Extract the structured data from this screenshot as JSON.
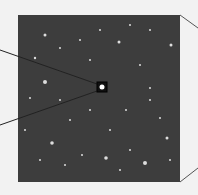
{
  "figure": {
    "colors": {
      "background": "#f2f2f2",
      "panel": "#3d3d3d",
      "lines": "#222222",
      "star": "#ffffff"
    },
    "highlight_box": {
      "x": 97,
      "y": 82,
      "w": 10,
      "h": 10
    },
    "stars": [
      [
        45,
        35,
        1.5
      ],
      [
        60,
        48,
        1
      ],
      [
        35,
        58,
        1.2
      ],
      [
        119,
        42,
        1.5
      ],
      [
        150,
        30,
        1
      ],
      [
        171,
        45,
        1.5
      ],
      [
        90,
        60,
        1
      ],
      [
        140,
        65,
        1
      ],
      [
        45,
        82,
        2
      ],
      [
        30,
        98,
        1
      ],
      [
        60,
        100,
        1
      ],
      [
        150,
        88,
        1
      ],
      [
        126,
        110,
        1
      ],
      [
        52,
        143,
        1.8
      ],
      [
        82,
        155,
        1
      ],
      [
        106,
        158,
        1.8
      ],
      [
        145,
        163,
        2
      ],
      [
        167,
        138,
        1.5
      ],
      [
        160,
        118,
        1
      ],
      [
        40,
        160,
        1
      ],
      [
        70,
        120,
        1
      ],
      [
        110,
        130,
        1
      ],
      [
        130,
        150,
        1
      ],
      [
        25,
        130,
        1
      ],
      [
        150,
        100,
        1
      ],
      [
        80,
        40,
        1
      ],
      [
        100,
        30,
        1
      ],
      [
        130,
        25,
        1
      ],
      [
        65,
        165,
        1
      ],
      [
        120,
        170,
        1
      ],
      [
        90,
        110,
        1
      ],
      [
        170,
        160,
        1
      ]
    ]
  }
}
